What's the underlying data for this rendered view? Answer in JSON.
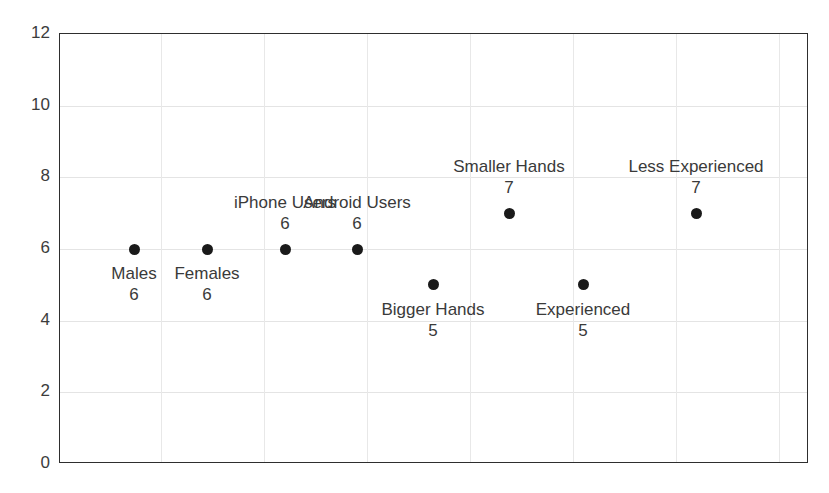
{
  "chart_data": {
    "type": "scatter",
    "title": "",
    "xlabel": "",
    "ylabel": "",
    "ylim": [
      0,
      12
    ],
    "grid": true,
    "legend": false,
    "y_ticks": [
      "12",
      "10",
      "8",
      "6",
      "4",
      "2",
      "0"
    ],
    "y_tick_values": [
      12,
      10,
      8,
      6,
      4,
      2,
      0
    ],
    "categories": [
      "Males",
      "Females",
      "iPhone Users",
      "Android Users",
      "Bigger Hands",
      "Smaller Hands",
      "Experienced",
      "Less Experienced"
    ],
    "values": [
      6,
      6,
      6,
      6,
      5,
      7,
      5,
      7
    ],
    "points": [
      {
        "name": "Males",
        "value": 6,
        "value_text": "6",
        "x_px": 133,
        "label_pos": "below"
      },
      {
        "name": "Females",
        "value": 6,
        "value_text": "6",
        "x_px": 206,
        "label_pos": "below"
      },
      {
        "name": "iPhone Users",
        "value": 6,
        "value_text": "6",
        "x_px": 284,
        "label_pos": "above"
      },
      {
        "name": "Android Users",
        "value": 6,
        "value_text": "6",
        "x_px": 356,
        "label_pos": "above"
      },
      {
        "name": "Bigger Hands",
        "value": 5,
        "value_text": "5",
        "x_px": 432,
        "label_pos": "below"
      },
      {
        "name": "Smaller Hands",
        "value": 7,
        "value_text": "7",
        "x_px": 508,
        "label_pos": "above"
      },
      {
        "name": "Experienced",
        "value": 5,
        "value_text": "5",
        "x_px": 582,
        "label_pos": "below"
      },
      {
        "name": "Less Experienced",
        "value": 7,
        "value_text": "7",
        "x_px": 695,
        "label_pos": "above"
      }
    ]
  },
  "colors": {
    "marker": "#1a1a1a",
    "frame": "#2e2e2e",
    "gridline": "#e4e4e4",
    "text": "#3a3a3a",
    "background": "#ffffff"
  }
}
